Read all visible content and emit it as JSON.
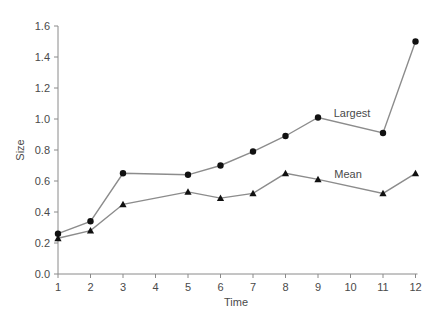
{
  "chart_data": {
    "type": "line",
    "title": "",
    "xlabel": "Time",
    "ylabel": "Size",
    "xlim": [
      1,
      12
    ],
    "ylim": [
      0.0,
      1.6
    ],
    "x_ticks": [
      1,
      2,
      3,
      4,
      5,
      6,
      7,
      8,
      9,
      10,
      11,
      12
    ],
    "y_ticks": [
      "0.0",
      "0.2",
      "0.4",
      "0.6",
      "0.8",
      "1.0",
      "1.2",
      "1.4",
      "1.6"
    ],
    "grid": false,
    "legend": "inline labels",
    "series": [
      {
        "name": "Largest",
        "marker": "circle",
        "x": [
          1,
          2,
          3,
          5,
          6,
          7,
          8,
          9,
          11,
          12
        ],
        "values": [
          0.26,
          0.34,
          0.65,
          0.64,
          0.7,
          0.79,
          0.89,
          1.01,
          0.91,
          1.5
        ],
        "label_pos": [
          352,
          117
        ]
      },
      {
        "name": "Mean",
        "marker": "triangle",
        "x": [
          1,
          2,
          3,
          5,
          6,
          7,
          8,
          9,
          11,
          12
        ],
        "values": [
          0.23,
          0.28,
          0.45,
          0.53,
          0.49,
          0.52,
          0.65,
          0.61,
          0.52,
          0.65
        ],
        "label_pos": [
          348,
          178
        ]
      }
    ],
    "colors": {
      "line": "#8c8c8c",
      "marker": "#111111",
      "axis": "#8a8a8a",
      "text": "#4a4a4a"
    }
  }
}
